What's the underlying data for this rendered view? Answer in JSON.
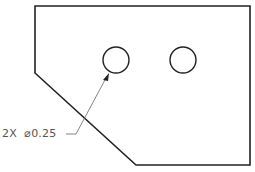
{
  "drawing": {
    "part_outline": {
      "points": "35,6 250,6 250,165 136,165 35,73",
      "stroke": "#222222"
    },
    "holes": [
      {
        "cx": 116,
        "cy": 60,
        "r": 13
      },
      {
        "cx": 183,
        "cy": 60,
        "r": 13
      }
    ],
    "callout": {
      "text": "2X  ⌀0.25",
      "leader_points": "66,134 76,134 107,76",
      "arrow_tip": [
        108,
        73
      ],
      "color": "#555555"
    }
  }
}
